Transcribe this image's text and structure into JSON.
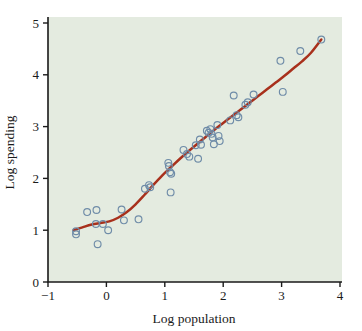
{
  "chart_data": {
    "type": "scatter",
    "title": "",
    "xlabel": "Log population",
    "ylabel": "Log spending",
    "xlim": [
      -1,
      4
    ],
    "ylim": [
      0,
      5
    ],
    "xticks": [
      -1,
      0,
      1,
      2,
      3,
      4
    ],
    "xtick_labels": [
      "−1",
      "0",
      "1",
      "2",
      "3",
      "4"
    ],
    "yticks": [
      0,
      1,
      2,
      3,
      4,
      5
    ],
    "ytick_labels": [
      "0",
      "1",
      "2",
      "3",
      "4",
      "5"
    ],
    "grid": false,
    "legend": "none",
    "plot_background_color": "#e4ebe0",
    "figure_background_color": "#ffffff",
    "marker_style": "open-circle",
    "marker_edge_color": "#6f8ca8",
    "curve_color": "#a8301c",
    "axis_color": "#1a1a1a",
    "series": [
      {
        "name": "observations",
        "type": "scatter",
        "points": [
          [
            -0.52,
            0.98
          ],
          [
            -0.52,
            0.92
          ],
          [
            -0.33,
            1.35
          ],
          [
            -0.17,
            1.39
          ],
          [
            -0.18,
            1.12
          ],
          [
            -0.15,
            0.73
          ],
          [
            -0.06,
            1.12
          ],
          [
            0.03,
            1.0
          ],
          [
            0.26,
            1.4
          ],
          [
            0.3,
            1.19
          ],
          [
            0.55,
            1.21
          ],
          [
            0.66,
            1.8
          ],
          [
            0.73,
            1.87
          ],
          [
            0.75,
            1.83
          ],
          [
            1.06,
            2.3
          ],
          [
            1.07,
            2.24
          ],
          [
            1.09,
            2.12
          ],
          [
            1.11,
            2.09
          ],
          [
            1.1,
            1.73
          ],
          [
            1.32,
            2.55
          ],
          [
            1.38,
            2.47
          ],
          [
            1.42,
            2.42
          ],
          [
            1.53,
            2.64
          ],
          [
            1.57,
            2.38
          ],
          [
            1.6,
            2.75
          ],
          [
            1.62,
            2.65
          ],
          [
            1.72,
            2.92
          ],
          [
            1.75,
            2.88
          ],
          [
            1.78,
            2.95
          ],
          [
            1.8,
            2.86
          ],
          [
            1.82,
            2.79
          ],
          [
            1.84,
            2.66
          ],
          [
            1.9,
            3.03
          ],
          [
            1.92,
            2.82
          ],
          [
            1.94,
            2.72
          ],
          [
            2.12,
            3.12
          ],
          [
            2.18,
            3.6
          ],
          [
            2.23,
            3.22
          ],
          [
            2.26,
            3.18
          ],
          [
            2.38,
            3.42
          ],
          [
            2.42,
            3.47
          ],
          [
            2.52,
            3.62
          ],
          [
            2.98,
            4.27
          ],
          [
            3.02,
            3.67
          ],
          [
            3.32,
            4.46
          ],
          [
            3.68,
            4.68
          ]
        ]
      },
      {
        "name": "fitted-smooth-curve",
        "type": "line",
        "points": [
          [
            -0.56,
            1.0
          ],
          [
            -0.4,
            1.06
          ],
          [
            -0.25,
            1.11
          ],
          [
            -0.1,
            1.14
          ],
          [
            0.05,
            1.17
          ],
          [
            0.2,
            1.24
          ],
          [
            0.35,
            1.35
          ],
          [
            0.5,
            1.5
          ],
          [
            0.65,
            1.68
          ],
          [
            0.8,
            1.87
          ],
          [
            0.95,
            2.05
          ],
          [
            1.1,
            2.21
          ],
          [
            1.25,
            2.37
          ],
          [
            1.4,
            2.52
          ],
          [
            1.55,
            2.66
          ],
          [
            1.7,
            2.8
          ],
          [
            1.85,
            2.94
          ],
          [
            2.0,
            3.07
          ],
          [
            2.15,
            3.2
          ],
          [
            2.3,
            3.33
          ],
          [
            2.45,
            3.46
          ],
          [
            2.6,
            3.59
          ],
          [
            2.75,
            3.72
          ],
          [
            2.9,
            3.85
          ],
          [
            3.05,
            3.98
          ],
          [
            3.2,
            4.12
          ],
          [
            3.35,
            4.26
          ],
          [
            3.5,
            4.42
          ],
          [
            3.68,
            4.68
          ]
        ]
      }
    ]
  }
}
